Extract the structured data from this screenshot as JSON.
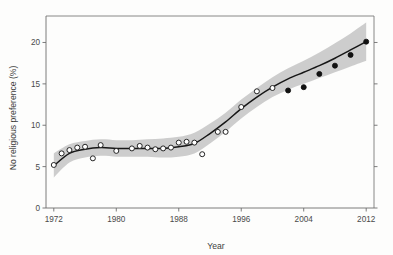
{
  "chart_data": {
    "type": "scatter",
    "title": "",
    "xlabel": "Year",
    "ylabel": "No religious preference (%)",
    "xlim": [
      1971,
      2013
    ],
    "ylim": [
      0,
      23.2
    ],
    "xticks": [
      1972,
      1980,
      1988,
      1996,
      2004,
      2012
    ],
    "yticks": [
      0,
      5,
      10,
      15,
      20
    ],
    "grid": false,
    "legend": "none",
    "marker_note": "open circles = earlier survey observations; filled circles = later survey observations",
    "series": [
      {
        "name": "Observed (open circles)",
        "marker": "open-circle",
        "x": [
          1972,
          1973,
          1974,
          1975,
          1976,
          1977,
          1978,
          1980,
          1982,
          1983,
          1984,
          1985,
          1986,
          1987,
          1988,
          1989,
          1990,
          1991,
          1993,
          1994,
          1996,
          1998,
          2000
        ],
        "y": [
          5.2,
          6.6,
          7.0,
          7.3,
          7.4,
          6.0,
          7.6,
          6.9,
          7.2,
          7.5,
          7.3,
          7.1,
          7.2,
          7.3,
          7.9,
          8.0,
          7.9,
          6.5,
          9.2,
          9.2,
          12.2,
          14.1,
          14.5
        ]
      },
      {
        "name": "Observed (filled circles)",
        "marker": "filled-circle",
        "x": [
          2002,
          2004,
          2006,
          2008,
          2010,
          2012
        ],
        "y": [
          14.2,
          14.6,
          16.2,
          17.2,
          18.5,
          20.1
        ]
      },
      {
        "name": "Fitted trend",
        "marker": "line",
        "x": [
          1972,
          1974,
          1976,
          1978,
          1980,
          1982,
          1984,
          1986,
          1988,
          1990,
          1992,
          1994,
          1996,
          1998,
          2000,
          2002,
          2004,
          2006,
          2008,
          2010,
          2012
        ],
        "y": [
          5.1,
          6.6,
          7.1,
          7.3,
          7.2,
          7.2,
          7.2,
          7.2,
          7.4,
          7.8,
          9.0,
          10.4,
          12.0,
          13.4,
          14.6,
          15.6,
          16.4,
          17.2,
          18.1,
          19.1,
          20.1
        ]
      },
      {
        "name": "Confidence band upper",
        "marker": "band",
        "x": [
          1972,
          1974,
          1976,
          1978,
          1980,
          1982,
          1984,
          1986,
          1988,
          1990,
          1992,
          1994,
          1996,
          1998,
          2000,
          2002,
          2004,
          2006,
          2008,
          2010,
          2012
        ],
        "y": [
          6.6,
          7.7,
          8.1,
          8.3,
          8.2,
          8.2,
          8.3,
          8.4,
          8.6,
          9.1,
          10.2,
          11.5,
          13.1,
          14.5,
          15.8,
          16.9,
          17.8,
          18.8,
          19.9,
          21.1,
          22.4
        ]
      },
      {
        "name": "Confidence band lower",
        "marker": "band",
        "x": [
          1972,
          1974,
          1976,
          1978,
          1980,
          1982,
          1984,
          1986,
          1988,
          1990,
          1992,
          1994,
          1996,
          1998,
          2000,
          2002,
          2004,
          2006,
          2008,
          2010,
          2012
        ],
        "y": [
          3.7,
          5.5,
          6.1,
          6.3,
          6.2,
          6.2,
          6.2,
          6.1,
          6.2,
          6.6,
          7.8,
          9.2,
          10.8,
          12.2,
          13.4,
          14.3,
          15.0,
          15.7,
          16.4,
          17.1,
          17.8
        ]
      }
    ],
    "colors": {
      "band": "#c9c9c9",
      "line": "#171717",
      "open_marker_fill": "#ffffff",
      "marker_stroke": "#1a1a1a",
      "filled_marker": "#111111",
      "axis": "#6e6e6e",
      "background": "#fdfdfc"
    }
  }
}
